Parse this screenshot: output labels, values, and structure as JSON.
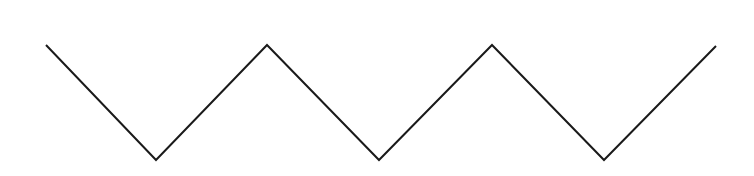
{
  "canvas": {
    "width": 754,
    "height": 176,
    "background": "#ffffff"
  },
  "zigzag": {
    "stroke": "#1a1a1a",
    "stroke_width": 2,
    "points": [
      [
        46,
        45
      ],
      [
        156,
        160
      ],
      [
        267,
        45
      ],
      [
        379,
        160
      ],
      [
        492,
        45
      ],
      [
        604,
        160
      ],
      [
        716,
        46
      ]
    ]
  }
}
